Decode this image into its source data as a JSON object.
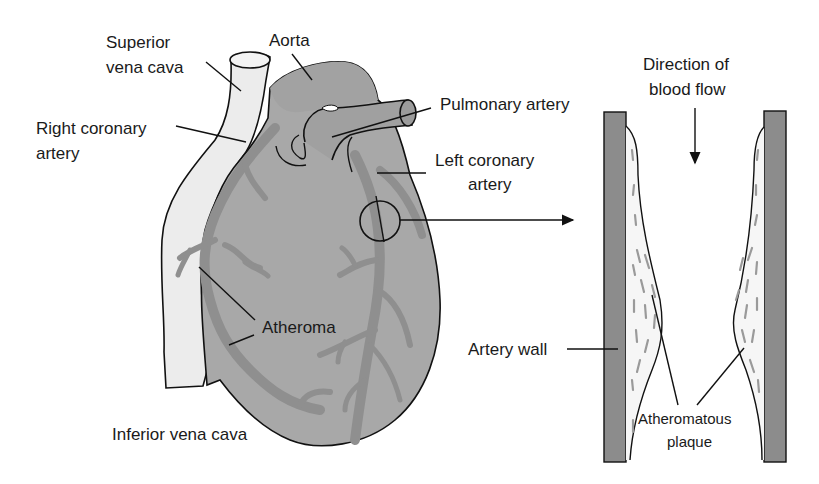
{
  "diagram": {
    "type": "anatomical-illustration",
    "colors": {
      "heart_fill": "#a8a8a8",
      "vessel_fill": "#8f8f8f",
      "vena_cava_fill": "#ececec",
      "artery_wall_fill": "#8c8c8c",
      "plaque_fleck": "#9a9a9a",
      "outline": "#111111",
      "background": "#ffffff"
    },
    "heart_labels": {
      "superior_vena_cava": [
        "Superior",
        "vena cava"
      ],
      "aorta": "Aorta",
      "pulmonary_artery": "Pulmonary artery",
      "right_coronary_artery": [
        "Right coronary",
        "artery"
      ],
      "left_coronary_artery": [
        "Left coronary",
        "artery"
      ],
      "atheroma": "Atheroma",
      "inferior_vena_cava": "Inferior vena cava"
    },
    "cross_section_labels": {
      "direction_of_blood_flow": [
        "Direction of",
        "blood flow"
      ],
      "artery_wall": "Artery wall",
      "atheromatous_plaque": [
        "Atheromatous",
        "plaque"
      ]
    },
    "connectors": {
      "magnify_arrow": "circle on left coronary artery → enlarged artery section",
      "flow_arrow": "downward"
    }
  }
}
